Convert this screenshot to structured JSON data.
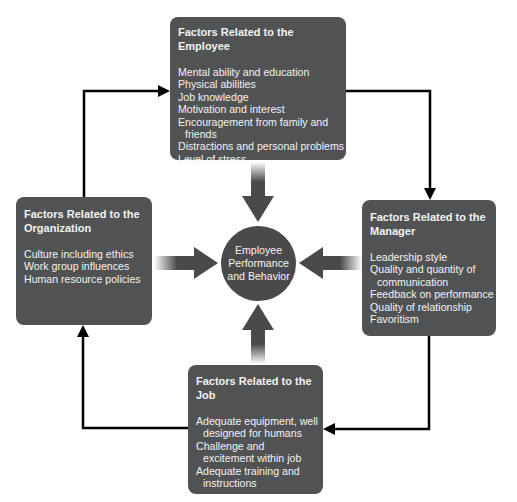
{
  "diagram": {
    "center": {
      "lines": [
        "Employee",
        "Performance",
        "and Behavior"
      ]
    },
    "employee": {
      "title": "Factors Related to the Employee",
      "items": [
        {
          "text": "Mental ability and education"
        },
        {
          "text": "Physical abilities"
        },
        {
          "text": "Job knowledge"
        },
        {
          "text": "Motivation and interest"
        },
        {
          "text": "Encouragement from family and",
          "cont": "friends"
        },
        {
          "text": "Distractions and personal problems"
        },
        {
          "text": "Level of stress"
        }
      ]
    },
    "organization": {
      "title_l1": "Factors Related to the",
      "title_l2": "Organization",
      "items": [
        {
          "text": "Culture including ethics"
        },
        {
          "text": "Work group influences"
        },
        {
          "text": "Human resource policies"
        }
      ]
    },
    "manager": {
      "title_l1": "Factors Related to the",
      "title_l2": "Manager",
      "items": [
        {
          "text": "Leadership style"
        },
        {
          "text": "Quality and quantity of",
          "cont": "communication"
        },
        {
          "text": "Feedback on performance"
        },
        {
          "text": "Quality of relationship"
        },
        {
          "text": "Favoritism"
        }
      ]
    },
    "job": {
      "title_l1": "Factors Related to the",
      "title_l2": "Job",
      "items": [
        {
          "text": "Adequate equipment, well",
          "cont": "designed for humans"
        },
        {
          "text": "Challenge and",
          "cont": "excitement within job"
        },
        {
          "text": "Adequate training and",
          "cont": "instructions"
        }
      ]
    },
    "colors": {
      "box": "#515254",
      "circle": "#4a4a4c",
      "arrow": "#000000",
      "text": "#f2f2f2"
    }
  }
}
